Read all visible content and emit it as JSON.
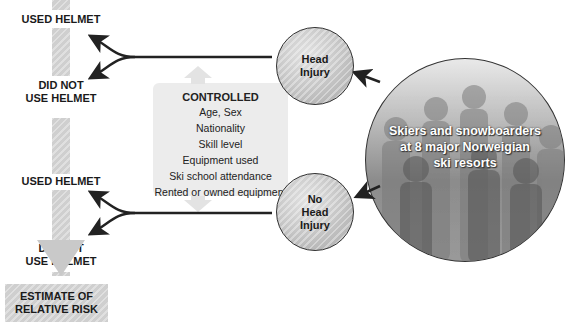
{
  "diagram": {
    "type": "study-design-flow",
    "outcomes": {
      "used_helmet_top": "USED HELMET",
      "did_not_use_helmet_top": [
        "DID NOT",
        "USE HELMET"
      ],
      "used_helmet_bottom": "USED HELMET",
      "did_not_use_helmet_bottom": [
        "DID NOT",
        "USE HELMET"
      ]
    },
    "result_box": [
      "ESTIMATE OF",
      "RELATIVE RISK"
    ],
    "controlled": {
      "title": "CONTROLLED",
      "items": [
        "Age, Sex",
        "Nationality",
        "Skill level",
        "Equipment used",
        "Ski school attendance",
        "Rented or owned equipment"
      ]
    },
    "groups": {
      "head_injury": [
        "Head",
        "Injury"
      ],
      "no_head_injury": [
        "No",
        "Head",
        "Injury"
      ]
    },
    "population": [
      "Skiers and snowboarders",
      "at 8 major Norweigian",
      "ski resorts"
    ],
    "colors": {
      "hatch_gray": "#cfcfcf",
      "box_gray": "#ececec",
      "arrow": "#222222",
      "text": "#1a1a1a",
      "population_text": "#ffffff"
    }
  }
}
